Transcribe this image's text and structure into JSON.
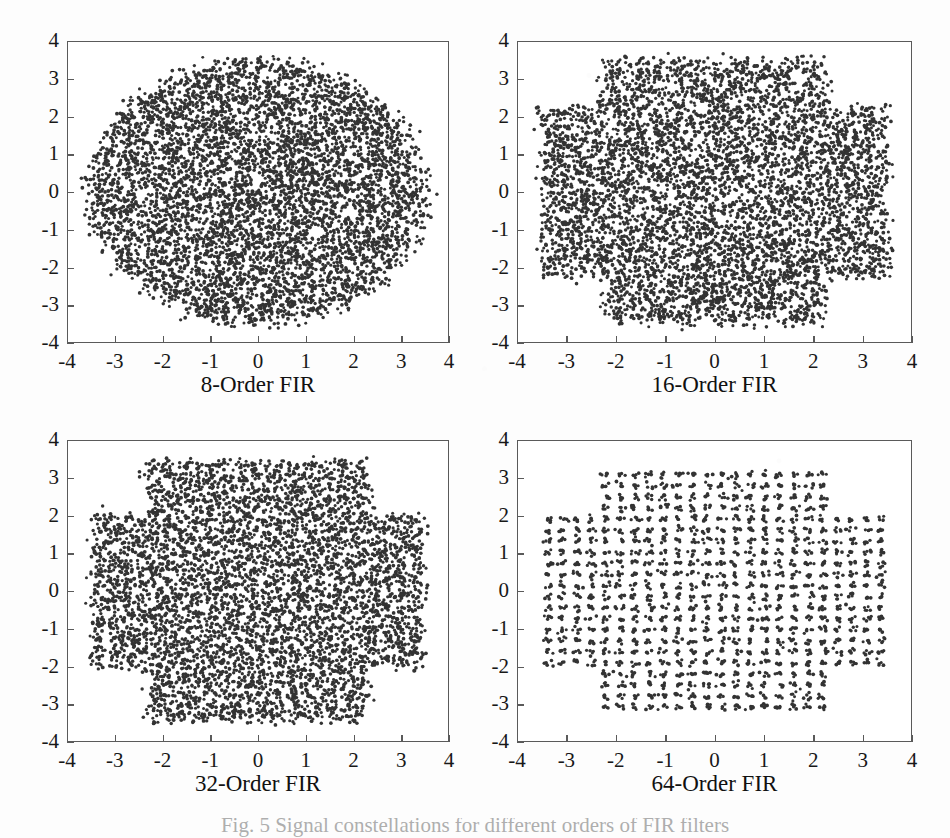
{
  "figure": {
    "caption_fragment": "Fig. 5  Signal constellations for different orders of FIR filters",
    "point_color": "#333333",
    "axis_color": "#5a5a5a",
    "background_color": "#ffffff"
  },
  "axis": {
    "xticks": [
      "-4",
      "-3",
      "-2",
      "-1",
      "0",
      "1",
      "2",
      "3",
      "4"
    ],
    "yticks": [
      "4",
      "3",
      "2",
      "1",
      "0",
      "-1",
      "-2",
      "-3",
      "-4"
    ]
  },
  "chart_data": [
    {
      "type": "scatter",
      "title": "8-Order FIR",
      "xlabel": "8-Order FIR",
      "ylabel": "",
      "xlim": [
        -4,
        4
      ],
      "ylim": [
        -4,
        4
      ],
      "xticks": [
        -4,
        -3,
        -2,
        -1,
        0,
        1,
        2,
        3,
        4
      ],
      "yticks": [
        -4,
        -3,
        -2,
        -1,
        0,
        1,
        2,
        3,
        4
      ],
      "grid": false,
      "legend": "none",
      "marker": "filled-circle",
      "marker_color": "#333333",
      "n_points": 6000,
      "cloud_shape": "circular-blob",
      "cloud_radius": 3.55,
      "lattice_spacing": 0,
      "jitter_sigma": 0.55,
      "annotation": "Dense near-circular cloud of points spanning roughly -3.6 to 3.6 in both axes; individual 16-QAM lattice points are completely smeared together by severe ISI."
    },
    {
      "type": "scatter",
      "title": "16-Order FIR",
      "xlabel": "16-Order FIR",
      "ylabel": "",
      "xlim": [
        -4,
        4
      ],
      "ylim": [
        -4,
        4
      ],
      "xticks": [
        -4,
        -3,
        -2,
        -1,
        0,
        1,
        2,
        3,
        4
      ],
      "yticks": [
        -4,
        -3,
        -2,
        -1,
        0,
        1,
        2,
        3,
        4
      ],
      "grid": false,
      "legend": "none",
      "marker": "filled-circle",
      "marker_color": "#333333",
      "n_points": 6000,
      "cloud_shape": "rounded-square-cross",
      "cloud_radius": 3.5,
      "lattice_spacing": 0,
      "jitter_sigma": 0.42,
      "annotation": "Rounded square / cross-shaped cloud, extent about -3.5 to 3.5; horizontal arms extend to +/-3.5 between y = -2.2 and 2.2, still no resolvable constellation points."
    },
    {
      "type": "scatter",
      "title": "32-Order FIR",
      "xlabel": "32-Order FIR",
      "ylabel": "",
      "xlim": [
        -4,
        4
      ],
      "ylim": [
        -4,
        4
      ],
      "xticks": [
        -4,
        -3,
        -2,
        -1,
        0,
        1,
        2,
        3,
        4
      ],
      "yticks": [
        -4,
        -3,
        -2,
        -1,
        0,
        1,
        2,
        3,
        4
      ],
      "grid": false,
      "legend": "none",
      "marker": "filled-circle",
      "marker_color": "#333333",
      "n_points": 4200,
      "cloud_shape": "plus-cross",
      "cloud_radius": 3.4,
      "lattice_spacing": 0.29,
      "jitter_sigma": 0.11,
      "annotation": "Cross/plus shaped region: vertical arm spans x = -2.2..2.2 with y to +/-3.35, horizontal arm spans y = -2.1..2.1 with x to +/-3.4. A fine mesh/lattice of roughly 0.29-spaced rows and columns is now visible."
    },
    {
      "type": "scatter",
      "title": "64-Order FIR",
      "xlabel": "64-Order FIR",
      "ylabel": "",
      "xlim": [
        -4,
        4
      ],
      "ylim": [
        -4,
        4
      ],
      "xticks": [
        -4,
        -3,
        -2,
        -1,
        0,
        1,
        2,
        3,
        4
      ],
      "yticks": [
        -4,
        -3,
        -2,
        -1,
        0,
        1,
        2,
        3,
        4
      ],
      "grid": false,
      "legend": "none",
      "marker": "filled-circle",
      "marker_color": "#333333",
      "n_points": 2600,
      "cloud_shape": "plus-cross",
      "cloud_radius": 3.35,
      "lattice_spacing": 0.295,
      "jitter_sigma": 0.045,
      "annotation": "Same cross-shaped support as the 32-order case but points have collapsed into a clean discrete lattice of well separated clusters spaced about 0.30 apart."
    }
  ],
  "panels": [
    {
      "id": "panel-8-order",
      "caption": "8-Order FIR"
    },
    {
      "id": "panel-16-order",
      "caption": "16-Order FIR"
    },
    {
      "id": "panel-32-order",
      "caption": "32-Order FIR"
    },
    {
      "id": "panel-64-order",
      "caption": "64-Order FIR"
    }
  ]
}
